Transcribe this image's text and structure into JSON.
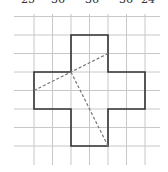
{
  "top_labels": [
    "25",
    "36",
    "36",
    "36",
    "24"
  ],
  "top_label_x": [
    28,
    60,
    95,
    130,
    150
  ],
  "colors": {
    "grid": "#c8c8c8",
    "outline": "#333333",
    "dashed": "#777777",
    "background": "#ffffff"
  },
  "grid": {
    "x_lines": [
      34,
      52.5,
      71,
      89.5,
      108,
      126.5,
      145
    ],
    "y_lines": [
      16.5,
      35,
      53.5,
      72,
      90.5,
      109,
      127.5,
      146
    ],
    "x_extent": [
      14,
      160
    ],
    "y_extent": [
      14,
      165
    ]
  },
  "cross_shape": {
    "points": "71,35 108,35 108,72 145,72 145,109 108,109 108,146 71,146 71,109 34,109 34,72 71,72"
  },
  "dashed_lines": [
    {
      "x1": 34,
      "y1": 90.5,
      "x2": 108,
      "y2": 53.5
    },
    {
      "x1": 71,
      "y1": 72,
      "x2": 108,
      "y2": 146
    }
  ]
}
